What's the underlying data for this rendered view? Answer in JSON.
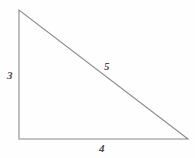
{
  "figure": {
    "name": "right-triangle-3-4-5",
    "background_color": "#fefefe",
    "stroke_color": "#8a8a8a",
    "label_color": "#4a4a4a",
    "width": 195,
    "height": 158
  },
  "geometry": {
    "vertices": {
      "apex": {
        "x": 19,
        "y": 10
      },
      "bottom_left": {
        "x": 19,
        "y": 139
      },
      "bottom_right": {
        "x": 188,
        "y": 139
      }
    },
    "polygon_points": "19,10 19,139 188,139"
  },
  "labels": {
    "vertical_leg": "3",
    "horizontal_leg": "4",
    "hypotenuse": "5"
  }
}
